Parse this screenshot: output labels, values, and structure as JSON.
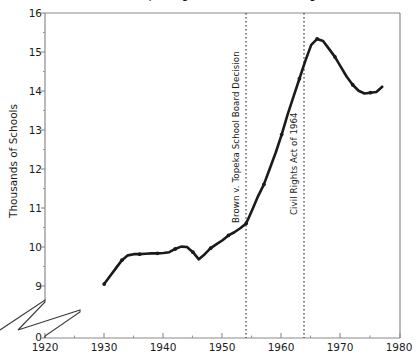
{
  "chart_data": {
    "type": "line",
    "title": "ended after the passage of the 1964 Civil Rights Act",
    "xlabel": "",
    "ylabel": "Thousands of Schools",
    "xlim": [
      1920,
      1980
    ],
    "ylim": [
      8.8,
      16
    ],
    "y_axis_break": true,
    "y_break_label": "0",
    "grid": false,
    "legend": "none",
    "xticks": [
      "1920",
      "1930",
      "1940",
      "1950",
      "1960",
      "1970",
      "1980"
    ],
    "yticks": [
      "9",
      "10",
      "11",
      "12",
      "13",
      "14",
      "15",
      "16"
    ],
    "x": [
      1930,
      1931,
      1932,
      1933,
      1934,
      1935,
      1936,
      1937,
      1938,
      1939,
      1940,
      1941,
      1942,
      1943,
      1944,
      1945,
      1946,
      1947,
      1948,
      1949,
      1950,
      1951,
      1952,
      1953,
      1954,
      1955,
      1956,
      1957,
      1958,
      1959,
      1960,
      1961,
      1962,
      1963,
      1964,
      1965,
      1966,
      1967,
      1968,
      1969,
      1970,
      1971,
      1972,
      1973,
      1974,
      1975,
      1976,
      1977
    ],
    "values": [
      9.2,
      9.4,
      9.6,
      9.8,
      9.92,
      9.95,
      9.95,
      9.96,
      9.97,
      9.97,
      9.98,
      10.0,
      10.08,
      10.14,
      10.13,
      10.0,
      9.82,
      9.95,
      10.1,
      10.2,
      10.3,
      10.42,
      10.5,
      10.6,
      10.72,
      11.05,
      11.4,
      11.7,
      12.1,
      12.5,
      12.95,
      13.45,
      13.9,
      14.35,
      14.8,
      15.2,
      15.35,
      15.3,
      15.1,
      14.9,
      14.65,
      14.4,
      14.2,
      14.05,
      13.98,
      14.0,
      14.02,
      14.15
    ],
    "annotations": [
      {
        "label": "Brown v. Topeka School Board Decision",
        "x": 1954,
        "line_style": "dotted"
      },
      {
        "label": "Civil Rights Act of 1964",
        "x": 1964,
        "line_style": "dotted"
      }
    ],
    "colors": {
      "line": "#1a1a1a",
      "axis": "#808080",
      "annotation_line": "#1a1a1a",
      "background": "#ffffff"
    }
  }
}
